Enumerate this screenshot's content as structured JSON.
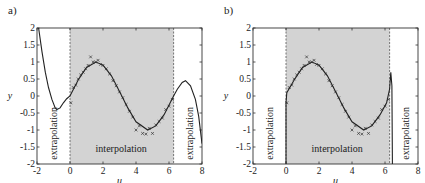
{
  "chart_data": [
    {
      "panel": "a)",
      "type": "line",
      "xlabel": "u",
      "ylabel": "y",
      "xlim": [
        -2,
        8
      ],
      "ylim": [
        -2,
        2
      ],
      "xticks": [
        "-2",
        "0",
        "2",
        "4",
        "6",
        "8"
      ],
      "yticks": [
        "2",
        "1.5",
        "1",
        "0.5",
        "0",
        "-0.5",
        "-1",
        "-1.5",
        "-2"
      ],
      "grid": false,
      "shaded_region": {
        "x_from": 0,
        "x_to": 6.28,
        "label": "interpolation"
      },
      "annotations": [
        {
          "text": "extrapolation",
          "x": -1.0,
          "orientation": "vertical"
        },
        {
          "text": "interpolation",
          "x": 3.1,
          "y": -1.65
        },
        {
          "text": "extrapolation",
          "x": 7.3,
          "orientation": "vertical"
        }
      ],
      "series": [
        {
          "name": "model fit",
          "style": "solid line",
          "x": [
            -1.9,
            -1.7,
            -1.5,
            -1.3,
            -1.1,
            -0.9,
            -0.8,
            -0.6,
            -0.4,
            -0.2,
            0,
            0.5,
            1.0,
            1.57,
            2.0,
            2.5,
            3.14,
            3.5,
            4.0,
            4.71,
            5.2,
            5.7,
            6.28,
            6.5,
            6.8,
            7.0,
            7.3,
            7.6,
            7.8,
            8.0
          ],
          "y": [
            2.0,
            1.3,
            0.7,
            0.25,
            -0.1,
            -0.35,
            -0.4,
            -0.35,
            -0.2,
            -0.08,
            0.0,
            0.48,
            0.84,
            1.0,
            0.91,
            0.6,
            0.0,
            -0.35,
            -0.76,
            -1.0,
            -0.88,
            -0.55,
            0.0,
            0.2,
            0.4,
            0.45,
            0.3,
            -0.1,
            -0.6,
            -1.4
          ]
        },
        {
          "name": "training data",
          "style": "x markers (noisy samples of sin(u) on [0, 2π])",
          "x": [
            0.05,
            0.2,
            0.35,
            0.5,
            0.65,
            0.8,
            0.95,
            1.1,
            1.25,
            1.4,
            1.55,
            1.7,
            1.85,
            2.0,
            2.2,
            2.4,
            2.6,
            2.8,
            3.0,
            3.2,
            3.4,
            3.6,
            3.8,
            4.0,
            4.2,
            4.4,
            4.6,
            4.8,
            5.0,
            5.2,
            5.4,
            5.6,
            5.8,
            6.0,
            6.2
          ],
          "y": [
            -0.2,
            0.25,
            0.32,
            0.5,
            0.62,
            0.7,
            0.8,
            0.9,
            1.15,
            1.0,
            1.0,
            1.05,
            0.93,
            0.9,
            0.8,
            0.65,
            0.45,
            0.3,
            0.12,
            -0.05,
            -0.25,
            -0.45,
            -0.62,
            -1.0,
            -0.88,
            -1.1,
            -1.12,
            -0.95,
            -1.1,
            -0.85,
            -0.75,
            -0.65,
            -0.4,
            -0.3,
            -0.1
          ]
        }
      ]
    },
    {
      "panel": "b)",
      "type": "line",
      "xlabel": "u",
      "ylabel": "y",
      "xlim": [
        -2,
        8
      ],
      "ylim": [
        -2,
        2
      ],
      "xticks": [
        "-2",
        "0",
        "2",
        "4",
        "6",
        "8"
      ],
      "yticks": [
        "2",
        "1.5",
        "1",
        "0.5",
        "0",
        "-0.5",
        "-1",
        "-1.5",
        "-2"
      ],
      "grid": false,
      "shaded_region": {
        "x_from": 0,
        "x_to": 6.28,
        "label": "interpolation"
      },
      "annotations": [
        {
          "text": "extrapolation",
          "x": -1.0,
          "orientation": "vertical"
        },
        {
          "text": "interpolation",
          "x": 3.1,
          "y": -1.65
        },
        {
          "text": "extrapolation",
          "x": 7.3,
          "orientation": "vertical"
        }
      ],
      "series": [
        {
          "name": "model fit",
          "style": "solid line",
          "x": [
            0.0,
            0.0,
            0.05,
            0.5,
            1.0,
            1.57,
            2.0,
            2.5,
            3.14,
            3.5,
            4.0,
            4.71,
            5.2,
            5.7,
            6.1,
            6.28,
            6.35,
            6.42,
            6.45
          ],
          "y": [
            -2.0,
            -0.2,
            0.1,
            0.48,
            0.84,
            1.0,
            0.91,
            0.6,
            0.0,
            -0.35,
            -0.76,
            -1.0,
            -0.88,
            -0.55,
            -0.2,
            0.2,
            0.7,
            0.3,
            -2.0
          ]
        },
        {
          "name": "training data",
          "style": "x markers (noisy samples of sin(u) on [0, 2π])",
          "x": [
            0.05,
            0.2,
            0.35,
            0.5,
            0.65,
            0.8,
            0.95,
            1.1,
            1.25,
            1.4,
            1.55,
            1.7,
            1.85,
            2.0,
            2.2,
            2.4,
            2.6,
            2.8,
            3.0,
            3.2,
            3.4,
            3.6,
            3.8,
            4.0,
            4.2,
            4.4,
            4.6,
            4.8,
            5.0,
            5.2,
            5.4,
            5.6,
            5.8,
            6.0,
            6.2
          ],
          "y": [
            -0.2,
            0.25,
            0.32,
            0.5,
            0.62,
            0.7,
            0.8,
            0.9,
            1.15,
            1.0,
            1.0,
            1.05,
            0.93,
            0.9,
            0.8,
            0.65,
            0.45,
            0.3,
            0.12,
            -0.05,
            -0.25,
            -0.45,
            -0.62,
            -1.0,
            -0.88,
            -1.1,
            -1.12,
            -0.95,
            -1.1,
            -0.85,
            -0.75,
            -0.65,
            -0.4,
            -0.3,
            -0.1
          ]
        }
      ]
    }
  ],
  "panels": {
    "a": {
      "label": "a)",
      "xlabel": "u",
      "ylabel": "y",
      "left_note": "extrapolation",
      "center_note": "interpolation",
      "right_note": "extrapolation"
    },
    "b": {
      "label": "b)",
      "xlabel": "u",
      "ylabel": "y",
      "left_note": "extrapolation",
      "center_note": "interpolation",
      "right_note": "extrapolation"
    }
  },
  "colors": {
    "shade": "#d3d3d3",
    "line": "#222222",
    "axes": "#333333",
    "boundary_dash": "#555555"
  }
}
